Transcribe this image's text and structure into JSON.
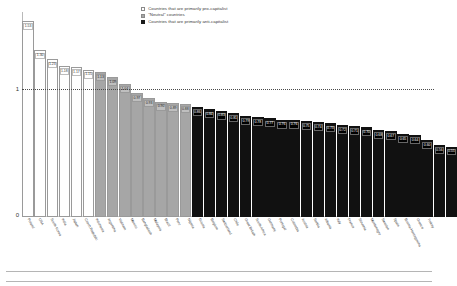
{
  "chart_data": {
    "type": "bar",
    "title": "",
    "xlabel": "",
    "ylabel": "",
    "ylim": [
      0,
      1.6
    ],
    "grid": false,
    "reference_line": {
      "value": 1,
      "style": "dotted",
      "label": "1"
    },
    "ytick_labels": [
      "1",
      "0"
    ],
    "legend_position": "top-center",
    "legend": [
      {
        "key": "pro",
        "label": "Countries that are primarily pro-capitalist",
        "color": "#ffffff"
      },
      {
        "key": "neutral",
        "label": "\"Neutral\" countries",
        "color": "#a6a6a6"
      },
      {
        "key": "anti",
        "label": "Countries that are primarily anti-capitalist",
        "color": "#111111"
      }
    ],
    "categories": [
      "Poland",
      "USA",
      "South Korea",
      "India",
      "Japan",
      "Czech Republic",
      "Indonesia",
      "Argentina",
      "Vietnam",
      "Mexico",
      "Bangladesh",
      "Malaysia",
      "Brazil",
      "Peru",
      "Nigeria",
      "Russia",
      "Belgium",
      "Switzerland",
      "Chile",
      "Great Britain",
      "South Africa",
      "Germany",
      "Portugal",
      "Colombia",
      "Austria",
      "Serbia",
      "Albania",
      "Italy",
      "France",
      "Slovenia",
      "Montenegro",
      "Sweden",
      "Spain",
      "Bosnia-Herzegovina",
      "Greece",
      "Turkey"
    ],
    "values": [
      1.53,
      1.3,
      1.23,
      1.18,
      1.17,
      1.15,
      1.13,
      1.09,
      1.04,
      0.97,
      0.93,
      0.9,
      0.89,
      0.88,
      0.86,
      0.84,
      0.83,
      0.81,
      0.79,
      0.78,
      0.77,
      0.76,
      0.76,
      0.75,
      0.74,
      0.73,
      0.72,
      0.71,
      0.7,
      0.68,
      0.67,
      0.65,
      0.64,
      0.6,
      0.56,
      0.55
    ],
    "groups": [
      "pro",
      "pro",
      "pro",
      "pro",
      "pro",
      "pro",
      "neutral",
      "neutral",
      "neutral",
      "neutral",
      "neutral",
      "neutral",
      "neutral",
      "neutral",
      "anti",
      "anti",
      "anti",
      "anti",
      "anti",
      "anti",
      "anti",
      "anti",
      "anti",
      "anti",
      "anti",
      "anti",
      "anti",
      "anti",
      "anti",
      "anti",
      "anti",
      "anti",
      "anti",
      "anti",
      "anti",
      "anti"
    ]
  }
}
